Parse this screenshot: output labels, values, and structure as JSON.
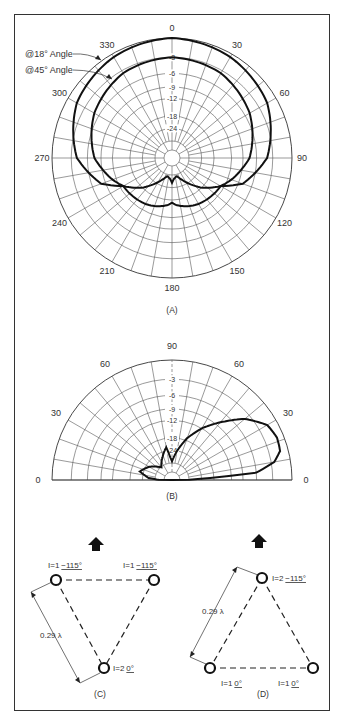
{
  "figure": {
    "panels": {
      "a": {
        "caption": "(A)",
        "type": "azimuth polar pattern",
        "azimuth_labels": [
          "0",
          "30",
          "60",
          "90",
          "120",
          "150",
          "180",
          "210",
          "240",
          "270",
          "300",
          "330"
        ],
        "db_labels": [
          "-3",
          "-6",
          "-9",
          "-12",
          "-18",
          "-24"
        ],
        "legend": [
          {
            "label": "@18° Angle"
          },
          {
            "label": "@45° Angle"
          }
        ]
      },
      "b": {
        "caption": "(B)",
        "type": "elevation polar pattern",
        "elevation_labels_left": [
          "0",
          "30",
          "60"
        ],
        "elevation_label_top": "90",
        "elevation_labels_right": [
          "60",
          "30",
          "0"
        ],
        "db_labels": [
          "-3",
          "-6",
          "-9",
          "-12",
          "-18",
          "-24"
        ]
      },
      "c": {
        "caption": "(C)",
        "spacing_label": "0.29 λ",
        "elements": [
          {
            "magnitude": "I=1",
            "phase": "−115°"
          },
          {
            "magnitude": "I=1",
            "phase": "−115°"
          },
          {
            "magnitude": "I=2",
            "phase": "0°"
          }
        ],
        "direction": "up-arrow"
      },
      "d": {
        "caption": "(D)",
        "spacing_label": "0.29 λ",
        "elements": [
          {
            "magnitude": "I=2",
            "phase": "−115°"
          },
          {
            "magnitude": "I=1",
            "phase": "0°"
          },
          {
            "magnitude": "I=1",
            "phase": "0°"
          }
        ],
        "direction": "up-arrow"
      }
    }
  },
  "chart_data": [
    {
      "type": "polar-line",
      "title": "(A) Azimuth pattern",
      "angle_unit": "degrees (azimuth)",
      "radial_unit": "dB relative",
      "radial_ticks": [
        0,
        -3,
        -6,
        -9,
        -12,
        -18,
        -24
      ],
      "series": [
        {
          "name": "@18° Angle",
          "angles": [
            0,
            30,
            60,
            90,
            110,
            120,
            135,
            150,
            165,
            175,
            180,
            185,
            195,
            210,
            225,
            240,
            250,
            270,
            300,
            330
          ],
          "values": [
            0,
            -0.5,
            -1.5,
            -4,
            -8,
            -13,
            -18,
            -25,
            -32,
            -30,
            -27,
            -30,
            -32,
            -25,
            -18,
            -13,
            -8,
            -4,
            -1.5,
            -0.5
          ]
        },
        {
          "name": "@45° Angle",
          "angles": [
            0,
            30,
            60,
            90,
            110,
            120,
            135,
            150,
            165,
            175,
            180,
            185,
            195,
            210,
            225,
            240,
            250,
            270,
            300,
            330
          ],
          "values": [
            -3,
            -3.5,
            -5,
            -7.5,
            -11,
            -13,
            -13.5,
            -14,
            -15,
            -16,
            -17,
            -16,
            -15,
            -14,
            -13.5,
            -13,
            -11,
            -7.5,
            -5,
            -3.5
          ]
        }
      ]
    },
    {
      "type": "polar-line",
      "title": "(B) Elevation pattern",
      "angle_unit": "degrees (elevation)",
      "radial_unit": "dB relative",
      "radial_ticks": [
        0,
        -3,
        -6,
        -9,
        -12,
        -18,
        -24
      ],
      "series": [
        {
          "name": "elevation",
          "angles": [
            0,
            5,
            10,
            15,
            22,
            30,
            40,
            50,
            60,
            70,
            80,
            85,
            90,
            95,
            100,
            110,
            130,
            150,
            165,
            175,
            180
          ],
          "values": [
            -40,
            -6,
            -2.5,
            -1.2,
            -1,
            -1.5,
            -4,
            -8,
            -12,
            -17,
            -24,
            -28,
            -32,
            -28,
            -22,
            -26,
            -34,
            -26,
            -22,
            -28,
            -40
          ]
        }
      ]
    }
  ]
}
